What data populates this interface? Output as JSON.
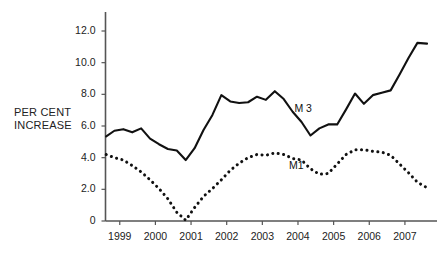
{
  "chart_data": {
    "type": "line",
    "title": "",
    "subtitle": "",
    "xlabel": "",
    "ylabel": "PER CENT\nINCREASE",
    "xlim": [
      1998.6,
      2007.9
    ],
    "ylim": [
      0,
      13.2
    ],
    "grid": false,
    "legend_position": "inline-annotation",
    "y_ticks": [
      "0",
      "2.0",
      "4.0",
      "6.0",
      "8.0",
      "10.0",
      "12.0"
    ],
    "y_tick_values": [
      0,
      2,
      4,
      6,
      8,
      10,
      12
    ],
    "x_ticks": [
      "1999",
      "2000",
      "2001",
      "2002",
      "2003",
      "2004",
      "2005",
      "2006",
      "2007"
    ],
    "x_tick_values": [
      1999,
      2000,
      2001,
      2002,
      2003,
      2004,
      2005,
      2006,
      2007
    ],
    "annotations": [
      {
        "text": "M 3",
        "x": 2003.9,
        "y": 7.1
      },
      {
        "text": "M1",
        "x": 2003.75,
        "y": 3.45
      }
    ],
    "series": [
      {
        "name": "M 3",
        "style": "solid",
        "x": [
          1998.62,
          1998.85,
          1999.1,
          1999.35,
          1999.6,
          1999.85,
          2000.1,
          2000.35,
          2000.6,
          2000.85,
          2001.1,
          2001.35,
          2001.6,
          2001.85,
          2002.1,
          2002.35,
          2002.6,
          2002.85,
          2003.1,
          2003.35,
          2003.6,
          2003.85,
          2004.1,
          2004.35,
          2004.6,
          2004.85,
          2005.1,
          2005.35,
          2005.6,
          2005.85,
          2006.1,
          2006.35,
          2006.6,
          2006.85,
          2007.1,
          2007.35,
          2007.62
        ],
        "values": [
          5.35,
          5.7,
          5.8,
          5.6,
          5.85,
          5.2,
          4.85,
          4.55,
          4.45,
          3.85,
          4.6,
          5.75,
          6.7,
          7.95,
          7.55,
          7.45,
          7.5,
          7.85,
          7.65,
          8.2,
          7.7,
          6.9,
          6.25,
          5.4,
          5.85,
          6.1,
          6.1,
          7.05,
          8.05,
          7.4,
          7.95,
          8.1,
          8.25,
          9.25,
          10.3,
          11.25,
          11.2
        ]
      },
      {
        "name": "M1",
        "style": "dotted",
        "x": [
          1998.62,
          1998.85,
          1999.1,
          1999.35,
          1999.6,
          1999.85,
          2000.1,
          2000.35,
          2000.6,
          2000.85,
          2001.1,
          2001.35,
          2001.6,
          2001.85,
          2002.1,
          2002.35,
          2002.6,
          2002.85,
          2003.1,
          2003.35,
          2003.6,
          2003.85,
          2004.1,
          2004.35,
          2004.6,
          2004.85,
          2005.1,
          2005.35,
          2005.6,
          2005.85,
          2006.1,
          2006.35,
          2006.6,
          2006.85,
          2007.1,
          2007.35,
          2007.62
        ],
        "values": [
          4.2,
          4.0,
          3.85,
          3.5,
          3.1,
          2.6,
          2.05,
          1.4,
          0.55,
          0.05,
          0.85,
          1.55,
          2.05,
          2.6,
          3.2,
          3.65,
          4.0,
          4.2,
          4.15,
          4.3,
          4.2,
          3.95,
          3.85,
          3.3,
          2.95,
          3.0,
          3.6,
          4.2,
          4.5,
          4.5,
          4.4,
          4.35,
          4.15,
          3.6,
          3.05,
          2.45,
          2.1
        ]
      }
    ]
  }
}
